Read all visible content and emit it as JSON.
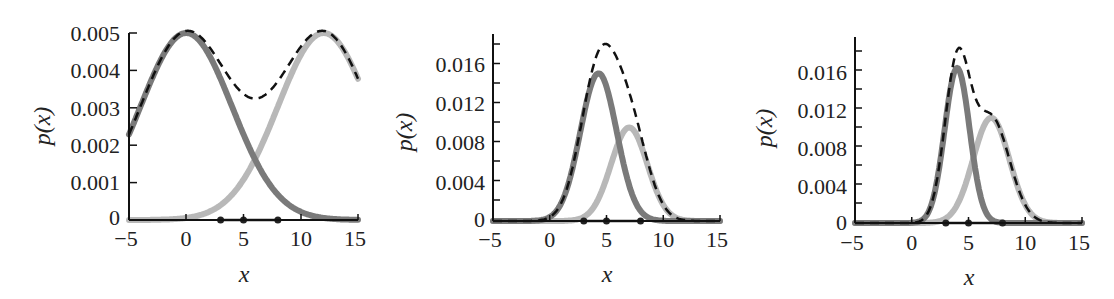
{
  "chart_data": [
    {
      "type": "line",
      "panel": 1,
      "xlabel": "x",
      "ylabel": "p(x)",
      "xlim": [
        -5,
        15
      ],
      "ylim": [
        0,
        0.005
      ],
      "xticks": [
        "−5",
        "0",
        "5",
        "10",
        "15"
      ],
      "yticks": [
        "0",
        "0.001",
        "0.002",
        "0.003",
        "0.004",
        "0.005"
      ],
      "grid": false,
      "data_points_on_axis": [
        3,
        5,
        8
      ],
      "series": [
        {
          "name": "component-1",
          "style": "solid dark gray",
          "color": "#7a7a7a",
          "mean": 0,
          "peak": 0.005,
          "sigma": 4
        },
        {
          "name": "component-2",
          "style": "solid light gray",
          "color": "#b8b8b8",
          "mean": 12,
          "peak": 0.005,
          "sigma": 4
        },
        {
          "name": "mixture",
          "style": "dashed black",
          "color": "#111111",
          "note": "sum; min ≈0.0033 at x≈6"
        }
      ]
    },
    {
      "type": "line",
      "panel": 2,
      "xlabel": "x",
      "ylabel": "p(x)",
      "xlim": [
        -5,
        15
      ],
      "ylim": [
        0,
        0.019
      ],
      "xticks": [
        "−5",
        "0",
        "5",
        "10",
        "15"
      ],
      "yticks": [
        "0",
        "0.004",
        "0.008",
        "0.012",
        "0.016"
      ],
      "grid": false,
      "data_points_on_axis": [
        3,
        5,
        8
      ],
      "series": [
        {
          "name": "component-1",
          "style": "solid dark gray",
          "color": "#7a7a7a",
          "mean": 4.3,
          "peak": 0.015,
          "sigma": 1.6
        },
        {
          "name": "component-2",
          "style": "solid light gray",
          "color": "#b8b8b8",
          "mean": 7,
          "peak": 0.0095,
          "sigma": 1.6
        },
        {
          "name": "mixture",
          "style": "dashed black",
          "color": "#111111",
          "note": "sum; peak ≈0.0195 at x≈5"
        }
      ]
    },
    {
      "type": "line",
      "panel": 3,
      "xlabel": "x",
      "ylabel": "p(x)",
      "xlim": [
        -5,
        15
      ],
      "ylim": [
        0,
        0.019
      ],
      "xticks": [
        "−5",
        "0",
        "5",
        "10",
        "15"
      ],
      "yticks": [
        "0",
        "0.004",
        "0.008",
        "0.012",
        "0.016"
      ],
      "grid": false,
      "data_points_on_axis": [
        3,
        5,
        8
      ],
      "series": [
        {
          "name": "component-1",
          "style": "solid dark gray",
          "color": "#7a7a7a",
          "mean": 4,
          "peak": 0.0162,
          "sigma": 1.1
        },
        {
          "name": "component-2",
          "style": "solid light gray",
          "color": "#b8b8b8",
          "mean": 7,
          "peak": 0.011,
          "sigma": 1.6
        },
        {
          "name": "mixture",
          "style": "dashed black",
          "color": "#111111",
          "note": "sum; peak ≈0.019 at x≈4.3"
        }
      ]
    }
  ],
  "panels": [
    {
      "ylabel": "p(x)",
      "xlabel": "x",
      "xticks": [
        "−5",
        "0",
        "5",
        "10",
        "15"
      ],
      "yticks": [
        "0",
        "0.001",
        "0.002",
        "0.003",
        "0.004",
        "0.005"
      ]
    },
    {
      "ylabel": "p(x)",
      "xlabel": "x",
      "xticks": [
        "−5",
        "0",
        "5",
        "10",
        "15"
      ],
      "yticks": [
        "0",
        "0.004",
        "0.008",
        "0.012",
        "0.016"
      ]
    },
    {
      "ylabel": "p(x)",
      "xlabel": "x",
      "xticks": [
        "−5",
        "0",
        "5",
        "10",
        "15"
      ],
      "yticks": [
        "0",
        "0.004",
        "0.008",
        "0.012",
        "0.016"
      ]
    }
  ],
  "colors": {
    "dark_component": "#7a7a7a",
    "light_component": "#b8b8b8",
    "mixture": "#111111",
    "axis": "#111111"
  }
}
